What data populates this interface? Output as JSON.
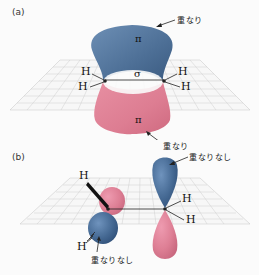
{
  "figure": {
    "panel_a": {
      "label": "(a)",
      "top_annotation": "重なり",
      "bottom_annotation": "重なり",
      "upper_lobe_symbol": "π",
      "lower_lobe_symbol": "π",
      "sigma_symbol": "σ",
      "atoms": {
        "left_top": "H",
        "left_bottom": "H",
        "right_top": "H",
        "right_bottom": "H"
      }
    },
    "panel_b": {
      "label": "(b)",
      "right_annotation": "重なりなし",
      "left_annotation": "重なりなし",
      "atoms": {
        "left_top": "H",
        "left_bottom": "H",
        "right_top": "H",
        "right_bottom": "H"
      }
    },
    "colors": {
      "positive_lobe": "#4d6f96",
      "negative_lobe": "#dd7d92",
      "grid": "#c9c9c9",
      "bond": "#222222"
    }
  }
}
